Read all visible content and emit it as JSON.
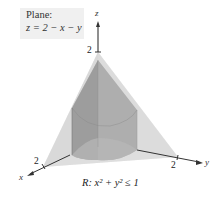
{
  "caption": {
    "line1": "Plane:",
    "line2": "z = 2 − x − y"
  },
  "region_label": "R: x² + y² ≤ 1",
  "axes": {
    "x": {
      "label": "x",
      "tick": "2"
    },
    "y": {
      "label": "y",
      "tick": "2"
    },
    "z": {
      "label": "z",
      "tick": "2"
    }
  },
  "colors": {
    "plane_fill": "#d8d8d8",
    "cylinder_fill": "#9a9a9a",
    "cylinder_dark": "#8a8a8a",
    "base_fill": "#e8e8e8",
    "axis": "#333333",
    "caption_bg": "#f0f0f0"
  }
}
